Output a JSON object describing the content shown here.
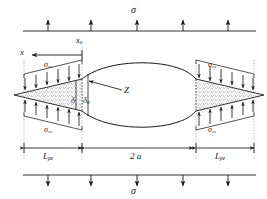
{
  "figure": {
    "type": "engineering-diagram",
    "labels": {
      "sigma_top": "σ",
      "sigma_bottom": "σ",
      "sigma_cs_top_left": "σ",
      "sigma_cs_top_left_sub": "cs",
      "sigma_cs_bottom_left": "σ",
      "sigma_cs_bottom_left_sub": "cs",
      "sigma_cs_top_right": "σ",
      "sigma_cs_top_right_sub": "cs",
      "sigma_cs_bottom_right": "σ",
      "sigma_cs_bottom_right_sub": "cs",
      "x_axis": "x",
      "x_origin": "x",
      "x_origin_sub": "o",
      "delta": "δ",
      "delta_zero": "δ",
      "delta_zero_sub": "o",
      "crack_tip": "Z",
      "len_pz_left": "L",
      "len_pz_left_sub": "pz",
      "len_pz_right": "L",
      "len_pz_right_sub": "pz",
      "half_crack": "2 a"
    },
    "colors": {
      "stroke": "#1a1a1a",
      "stipple": "#555555",
      "guide": "#8a8a8a",
      "background": "#ffffff"
    },
    "geometry": {
      "top_load_line_y": 31,
      "bottom_load_line_y": 175,
      "top_arrow_count": 5,
      "bottom_arrow_count": 5,
      "axis_y": 95,
      "x0_x": 82,
      "x_right_tip": 196,
      "left_frame_x": 24,
      "right_frame_x": 254,
      "dimension_line_y": 148
    }
  }
}
